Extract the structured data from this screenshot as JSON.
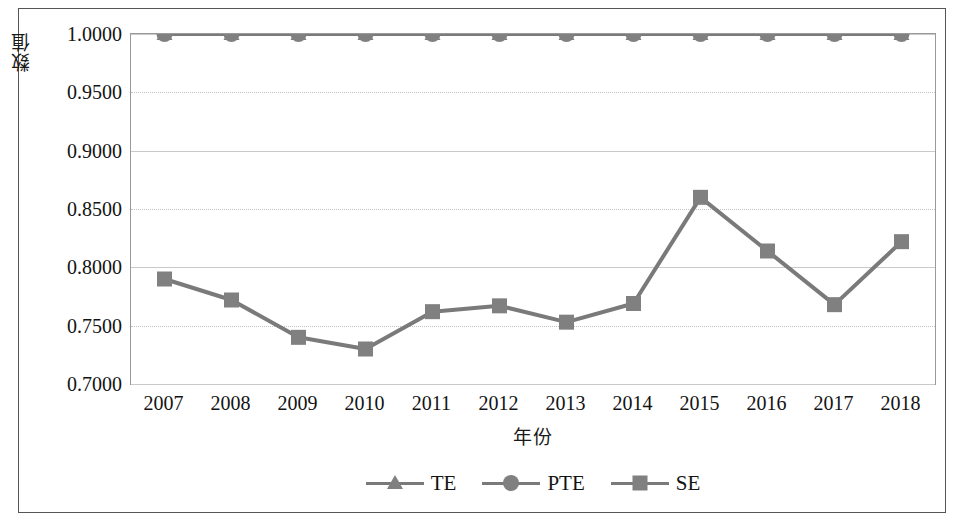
{
  "chart_data": {
    "type": "line",
    "title": "",
    "xlabel": "年份",
    "ylabel": "数值",
    "categories": [
      "2007",
      "2008",
      "2009",
      "2010",
      "2011",
      "2012",
      "2013",
      "2014",
      "2015",
      "2016",
      "2017",
      "2018"
    ],
    "x": [
      2007,
      2008,
      2009,
      2010,
      2011,
      2012,
      2013,
      2014,
      2015,
      2016,
      2017,
      2018
    ],
    "series": [
      {
        "name": "TE",
        "marker": "triangle",
        "color": "#7a7a7a",
        "values": [
          1.0,
          1.0,
          1.0,
          1.0,
          1.0,
          1.0,
          1.0,
          1.0,
          1.0,
          1.0,
          1.0,
          1.0
        ]
      },
      {
        "name": "PTE",
        "marker": "circle",
        "color": "#7a7a7a",
        "values": [
          1.0,
          1.0,
          1.0,
          1.0,
          1.0,
          1.0,
          1.0,
          1.0,
          1.0,
          1.0,
          1.0,
          1.0
        ]
      },
      {
        "name": "SE",
        "marker": "square",
        "color": "#7a7a7a",
        "values": [
          0.79,
          0.772,
          0.74,
          0.73,
          0.762,
          0.767,
          0.753,
          0.769,
          0.86,
          0.814,
          0.768,
          0.822
        ]
      }
    ],
    "ylim": [
      0.7,
      1.0
    ],
    "yticks": [
      1.0,
      0.95,
      0.9,
      0.85,
      0.8,
      0.75,
      0.7
    ],
    "ytick_labels": [
      "1.0000",
      "0.9500",
      "0.9000",
      "0.8500",
      "0.8000",
      "0.7500",
      "0.7000"
    ],
    "grid": true,
    "legend_position": "bottom"
  },
  "legend": {
    "items": [
      {
        "label": "TE",
        "marker": "triangle-marker-icon"
      },
      {
        "label": "PTE",
        "marker": "circle-marker-icon"
      },
      {
        "label": "SE",
        "marker": "square-marker-icon"
      }
    ]
  },
  "colors": {
    "series_line": "#7a7a7a",
    "marker_fill": "#808080",
    "gridline": "#c9c9c9",
    "plot_border": "#9a9a9a",
    "frame_border": "#555555",
    "text": "#131313",
    "background": "#ffffff"
  }
}
